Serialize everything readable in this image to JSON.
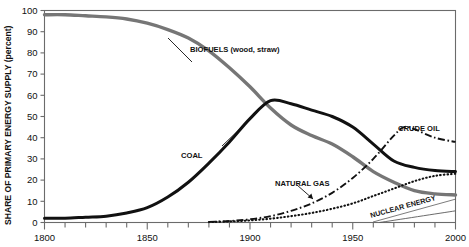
{
  "chart_data": {
    "type": "line",
    "title": "",
    "xlabel": "",
    "ylabel": "SHARE OF PRIMARY ENERGY SUPPLY (percent)",
    "xlim": [
      1800,
      2000
    ],
    "ylim": [
      0,
      100
    ],
    "xticks": [
      1800,
      1810,
      1820,
      1830,
      1840,
      1850,
      1860,
      1870,
      1880,
      1890,
      1900,
      1910,
      1920,
      1930,
      1940,
      1950,
      1960,
      1970,
      1980,
      1990,
      2000
    ],
    "xtick_labels": [
      "1800",
      "",
      "",
      "",
      "",
      "1850",
      "",
      "",
      "",
      "",
      "1900",
      "",
      "",
      "",
      "",
      "1950",
      "",
      "",
      "",
      "",
      "2000"
    ],
    "yticks": [
      0,
      10,
      20,
      30,
      40,
      50,
      60,
      70,
      80,
      90,
      100
    ],
    "ytick_labels": [
      "0",
      "10",
      "20",
      "30",
      "40",
      "50",
      "60",
      "70",
      "80",
      "90",
      "100"
    ],
    "grid": false,
    "legend": "inline-annotations",
    "series": [
      {
        "name": "BIOFUELS (wood, straw)",
        "label": "BIOFUELS (wood, straw)",
        "style": "solid-thick-gray",
        "color": "#767676",
        "x": [
          1800,
          1810,
          1820,
          1830,
          1840,
          1850,
          1860,
          1870,
          1880,
          1890,
          1900,
          1910,
          1920,
          1930,
          1940,
          1950,
          1960,
          1970,
          1980,
          1990,
          2000
        ],
        "values": [
          98,
          98,
          97.5,
          97,
          96,
          94,
          91,
          87,
          81,
          73,
          64,
          54,
          46,
          41,
          37,
          31,
          24,
          19,
          15,
          13.5,
          13
        ]
      },
      {
        "name": "COAL",
        "label": "COAL",
        "style": "solid-thick-black",
        "color": "#111111",
        "x": [
          1800,
          1810,
          1820,
          1830,
          1840,
          1850,
          1860,
          1870,
          1880,
          1890,
          1900,
          1910,
          1920,
          1930,
          1940,
          1950,
          1960,
          1970,
          1980,
          1990,
          2000
        ],
        "values": [
          2,
          2,
          2.5,
          3,
          4.5,
          7,
          12,
          19,
          28,
          38,
          49,
          57.5,
          56,
          53,
          50,
          45,
          37,
          29,
          26,
          24.5,
          24
        ]
      },
      {
        "name": "CRUDE OIL",
        "label": "CRUDE OIL",
        "style": "dash-dot-black",
        "color": "#111111",
        "x": [
          1880,
          1890,
          1900,
          1910,
          1920,
          1930,
          1940,
          1950,
          1960,
          1970,
          1975,
          1980,
          1990,
          2000
        ],
        "values": [
          0.3,
          0.7,
          1.5,
          3,
          5.5,
          9,
          14,
          21,
          30,
          41,
          45,
          44,
          40,
          38
        ]
      },
      {
        "name": "NATURAL GAS",
        "label": "NATURAL GAS",
        "style": "dotted-black",
        "color": "#111111",
        "x": [
          1880,
          1890,
          1900,
          1910,
          1920,
          1930,
          1940,
          1950,
          1960,
          1970,
          1980,
          1990,
          2000
        ],
        "values": [
          0.2,
          0.5,
          1,
          1.8,
          3,
          4.5,
          6.5,
          9,
          12.5,
          16,
          19.5,
          22,
          23
        ]
      },
      {
        "name": "NUCLEAR ENERGY",
        "label": "NUCLEAR ENERGY",
        "style": "solid-thin-gray",
        "color": "#5a5a5a",
        "x": [
          1963,
          2000
        ],
        "values": [
          0,
          5.5
        ]
      }
    ],
    "annotations": [
      {
        "text": "BIOFUELS (wood, straw)",
        "x": 1885,
        "y": 80
      },
      {
        "text": "COAL",
        "x": 1855,
        "y": 33
      },
      {
        "text": "CRUDE OIL",
        "x": 1979,
        "y": 47
      },
      {
        "text": "NATURAL GAS",
        "x": 1926,
        "y": 16
      },
      {
        "text": "NUCLEAR ENERGY",
        "x": 1968,
        "y": 4
      }
    ]
  }
}
